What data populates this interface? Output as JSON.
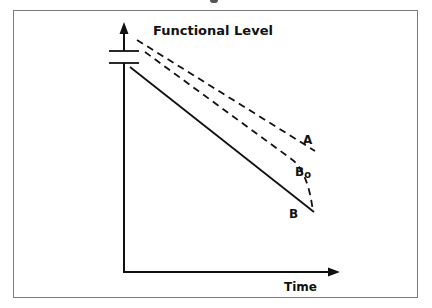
{
  "figure": {
    "y_axis_label": "Functional Level",
    "x_axis_label": "Time",
    "curves": [
      {
        "id": "A",
        "label": "A",
        "style": "dashed"
      },
      {
        "id": "B0",
        "label": "B",
        "subscript": "o",
        "style": "dashed"
      },
      {
        "id": "B",
        "label": "B",
        "style": "solid"
      }
    ]
  },
  "colors": {
    "ink": "#111111",
    "frame": "#7a7a7a"
  }
}
